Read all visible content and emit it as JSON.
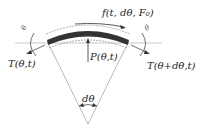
{
  "diagram": {
    "type": "free-body diagram of curved element",
    "labels": {
      "force_tangential": "f(t, dθ, F₀)",
      "pressure": "P(θ,t)",
      "tension_left": "T(θ,t)",
      "tension_right": "T(θ+dθ,t)",
      "angle": "dθ",
      "left_symbol": "θ",
      "right_symbol": "θ"
    },
    "colors": {
      "ink": "#222222",
      "band": "#333333",
      "guide": "#999999"
    }
  }
}
